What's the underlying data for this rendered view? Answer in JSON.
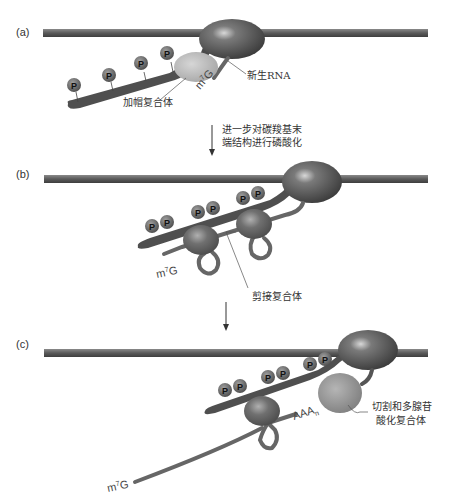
{
  "figure": {
    "panels": [
      {
        "id": "a",
        "label": "(a)",
        "labels": {
          "cap": "m7G",
          "cap_base": "m",
          "cap_sup": "7",
          "cap_rest": "G",
          "nascent_rna": "新生RNA",
          "capping_complex": "加帽复合体"
        },
        "phospho_count": 4
      },
      {
        "id": "b",
        "label": "(b)",
        "labels": {
          "cap_base": "m",
          "cap_sup": "7",
          "cap_rest": "G",
          "splicing_complex": "剪接复合体"
        },
        "phospho_count": 6
      },
      {
        "id": "c",
        "label": "(c)",
        "labels": {
          "cap_base": "m",
          "cap_sup": "7",
          "cap_rest": "G",
          "polya_tail": "AAA",
          "polya_sub": "n",
          "cleavage_complex_line1": "切割和多腺苷",
          "cleavage_complex_line2": "酸化复合体"
        },
        "phospho_count": 6
      }
    ],
    "transitions": [
      {
        "from": "a",
        "to": "b",
        "text_line1": "进一步对碳羧基末",
        "text_line2": "端结构进行磷酸化"
      },
      {
        "from": "b",
        "to": "c",
        "text_line1": "",
        "text_line2": ""
      }
    ],
    "phospho_symbol": "P",
    "colors": {
      "dna": "#5a5a5a",
      "polymerase": "#4a4a4a",
      "ctd_tail": "#4f4f4f",
      "phospho": "#5c5c5c",
      "capping_complex": "#b8b8b8",
      "splicing_complex": "#6a6a6a",
      "cleavage_complex": "#8f8f8f",
      "rna": "#666666",
      "text": "#333333"
    }
  }
}
